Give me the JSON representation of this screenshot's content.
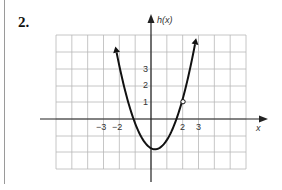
{
  "problem": {
    "number": "2."
  },
  "chart_data": {
    "type": "line",
    "title": "",
    "function_name": "h(x)",
    "xlabel": "x",
    "ylabel": "h(x)",
    "x_ticks": [
      {
        "value": -3,
        "label": "−3"
      },
      {
        "value": -2,
        "label": "−2"
      },
      {
        "value": 2,
        "label": "2"
      },
      {
        "value": 3,
        "label": "3"
      }
    ],
    "y_ticks": [
      {
        "value": 1,
        "label": "1"
      },
      {
        "value": 2,
        "label": "2"
      },
      {
        "value": 3,
        "label": "3"
      }
    ],
    "xlim": [
      -6,
      6
    ],
    "ylim": [
      -3,
      5
    ],
    "grid": true,
    "series": [
      {
        "name": "h(x)",
        "description": "upward-opening parabola with arrows at both ends, vertex near (0.25, -1.8)",
        "x": [
          -2.6,
          -2,
          -1.5,
          -1,
          -0.5,
          0,
          0.25,
          0.5,
          1,
          1.5,
          2,
          2.5,
          3.1
        ],
        "y": [
          6,
          3.3,
          1.3,
          -0.2,
          -1.3,
          -1.75,
          -1.8,
          -1.75,
          -1.2,
          -0.2,
          1,
          2.8,
          5.5
        ]
      }
    ],
    "annotations": [
      {
        "type": "open-circle",
        "x": 2,
        "y": 1
      }
    ],
    "legend": null,
    "colors": {
      "grid": "#b8b8b8",
      "axis": "#222222",
      "curve": "#111111"
    }
  }
}
